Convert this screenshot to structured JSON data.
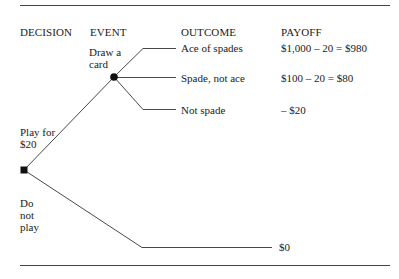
{
  "columns": {
    "decision": "DECISION",
    "event": "EVENT",
    "outcome": "OUTCOME",
    "payoff": "PAYOFF"
  },
  "decision_node": {
    "shape": "square",
    "branches": [
      {
        "label_line1": "Play for",
        "label_line2": "$20"
      },
      {
        "label_line1": "Do",
        "label_line2": "not",
        "label_line3": "play"
      }
    ]
  },
  "chance_node": {
    "shape": "circle",
    "label_line1": "Draw a",
    "label_line2": "card"
  },
  "outcomes": [
    {
      "outcome": "Ace of spades",
      "payoff": "$1,000 – 20 = $980"
    },
    {
      "outcome": "Spade, not ace",
      "payoff": "$100 – 20 = $80"
    },
    {
      "outcome": "Not spade",
      "payoff": "– $20"
    }
  ],
  "no_play_payoff": "$0",
  "colors": {
    "line": "#333333",
    "text": "#1a1a1a",
    "background": "#ffffff"
  }
}
